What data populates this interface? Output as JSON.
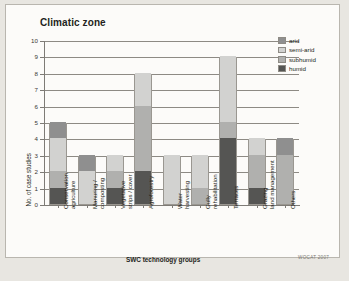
{
  "chart_title": "Climatic zone",
  "credit": "WOCAT 2007",
  "axes": {
    "ylabel": "No. of case studies",
    "xlabel": "SWC technology groups",
    "yticks": [
      "0",
      "1",
      "2",
      "3",
      "4",
      "5",
      "6",
      "7",
      "8",
      "9",
      "10"
    ]
  },
  "legend": {
    "items": [
      {
        "label": "arid",
        "color": "#8f8f8f"
      },
      {
        "label": "semi-arid",
        "color": "#d2d2d0"
      },
      {
        "label": "subhumid",
        "color": "#b0b0ae"
      },
      {
        "label": "humid",
        "color": "#555553"
      }
    ]
  },
  "chart_data": {
    "type": "bar",
    "title": "Climatic zone",
    "xlabel": "SWC technology groups",
    "ylabel": "No. of case studies",
    "ylim": [
      0,
      10
    ],
    "grid": true,
    "legend_position": "top-right",
    "stacked": true,
    "categories": [
      "Conservation agriculture",
      "Manuring / composting",
      "Vegetative strips / cover",
      "Agroforestry",
      "Water harvesting",
      "Gully rehabilitation",
      "Terraces",
      "Grazing land management",
      "Others"
    ],
    "series": [
      {
        "name": "humid",
        "color": "#555553",
        "values": [
          1,
          0,
          1,
          2,
          0,
          0,
          4,
          1,
          0
        ]
      },
      {
        "name": "subhumid",
        "color": "#b0b0ae",
        "values": [
          1,
          0,
          1,
          4,
          0,
          1,
          1,
          2,
          3
        ]
      },
      {
        "name": "semi-arid",
        "color": "#d2d2d0",
        "values": [
          2,
          2,
          1,
          2,
          3,
          2,
          4,
          1,
          0
        ]
      },
      {
        "name": "arid",
        "color": "#8f8f8f",
        "values": [
          1,
          1,
          0,
          0,
          0,
          0,
          0,
          0,
          1
        ]
      }
    ],
    "totals": [
      5,
      3,
      3,
      8,
      3,
      3,
      9,
      4,
      4
    ]
  }
}
